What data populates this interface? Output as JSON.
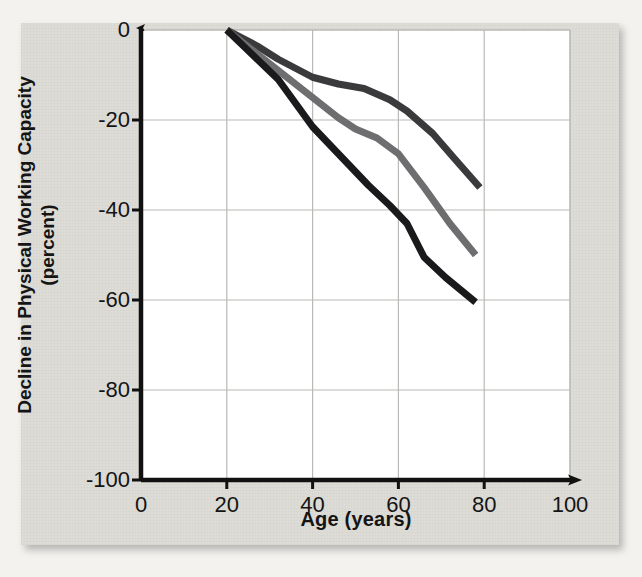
{
  "figure": {
    "background_color": "#dddcd7",
    "plot_background_color": "#ffffff",
    "axis_color": "#111111",
    "grid_color": "#b9b9b5"
  },
  "chart_data": {
    "type": "line",
    "title": "",
    "subtitle": "",
    "xlabel": "Age (years)",
    "ylabel": "Decline in Physical Working Capacity (percent)",
    "xlim": [
      0,
      100
    ],
    "ylim": [
      -100,
      0
    ],
    "xticks": [
      "0",
      "20",
      "40",
      "60",
      "80",
      "100"
    ],
    "xtick_values": [
      0,
      20,
      40,
      60,
      80,
      100
    ],
    "yticks": [
      "0",
      "-20",
      "-40",
      "-60",
      "-80",
      "-100"
    ],
    "ytick_values": [
      0,
      -20,
      -40,
      -60,
      -80,
      -100
    ],
    "grid": true,
    "grid_axes": "both",
    "legend": "none",
    "annotations": [],
    "series": [
      {
        "name": "Upper curve (least decline)",
        "color": "#3a3a3c",
        "width": 7,
        "x": [
          20,
          27,
          32,
          40,
          46,
          52,
          58,
          62,
          68,
          73,
          79
        ],
        "y": [
          0,
          -3.5,
          -6.5,
          -10.5,
          -12.0,
          -13.0,
          -15.5,
          -18.0,
          -23.0,
          -28.5,
          -35.0
        ]
      },
      {
        "name": "Middle curve (moderate decline)",
        "color": "#6e6e70",
        "width": 7,
        "x": [
          20,
          26,
          32,
          40,
          46,
          50,
          55,
          60,
          66,
          72,
          78
        ],
        "y": [
          0,
          -4.5,
          -9.0,
          -15.0,
          -19.5,
          -22.0,
          -24.0,
          -27.5,
          -35.0,
          -43.0,
          -50.0
        ]
      },
      {
        "name": "Lower curve (greatest decline)",
        "color": "#1a1a1c",
        "width": 7,
        "x": [
          20,
          26,
          32,
          40,
          47,
          53,
          58,
          62,
          66,
          71,
          78
        ],
        "y": [
          0,
          -5.5,
          -11.0,
          -21.5,
          -28.5,
          -34.5,
          -39.0,
          -43.0,
          -50.5,
          -55.0,
          -60.5
        ]
      }
    ]
  }
}
